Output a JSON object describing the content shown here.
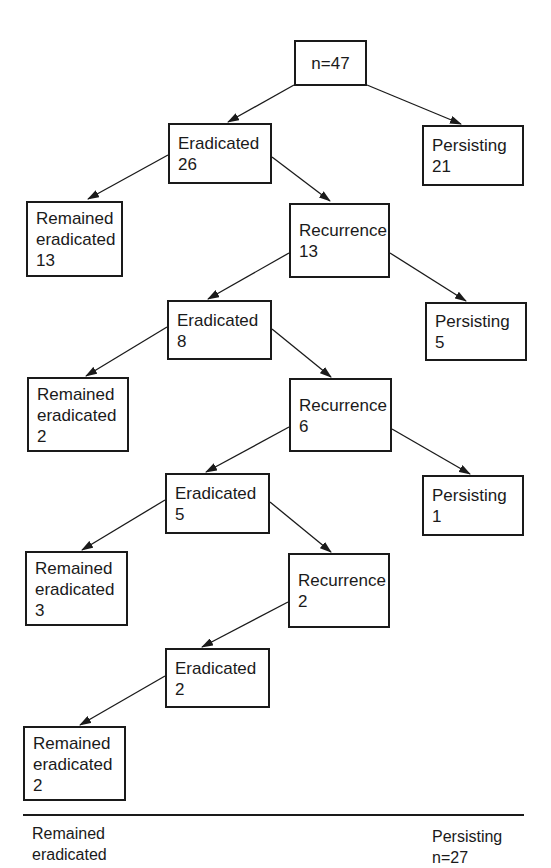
{
  "diagram": {
    "type": "flowchart-tree",
    "root": {
      "label": "n=47"
    },
    "nodes": [
      {
        "id": "erad1",
        "label": "Eradicated",
        "value": "26"
      },
      {
        "id": "pers1",
        "label": "Persisting",
        "value": "21"
      },
      {
        "id": "rem1",
        "label": "Remained eradicated",
        "value": "13"
      },
      {
        "id": "rec1",
        "label": "Recurrence",
        "value": "13"
      },
      {
        "id": "erad2",
        "label": "Eradicated",
        "value": "8"
      },
      {
        "id": "pers2",
        "label": "Persisting",
        "value": "5"
      },
      {
        "id": "rem2",
        "label": "Remained eradicated",
        "value": "2"
      },
      {
        "id": "rec2",
        "label": "Recurrence",
        "value": "6"
      },
      {
        "id": "erad3",
        "label": "Eradicated",
        "value": "5"
      },
      {
        "id": "pers3",
        "label": "Persisting",
        "value": "1"
      },
      {
        "id": "rem3",
        "label": "Remained eradicated",
        "value": "3"
      },
      {
        "id": "rec3",
        "label": "Recurrence",
        "value": "2"
      },
      {
        "id": "erad4",
        "label": "Eradicated",
        "value": "2"
      },
      {
        "id": "rem4",
        "label": "Remained eradicated",
        "value": "2"
      }
    ],
    "edges": [
      [
        "root",
        "erad1"
      ],
      [
        "root",
        "pers1"
      ],
      [
        "erad1",
        "rem1"
      ],
      [
        "erad1",
        "rec1"
      ],
      [
        "rec1",
        "erad2"
      ],
      [
        "rec1",
        "pers2"
      ],
      [
        "erad2",
        "rem2"
      ],
      [
        "erad2",
        "rec2"
      ],
      [
        "rec2",
        "erad3"
      ],
      [
        "rec2",
        "pers3"
      ],
      [
        "erad3",
        "rem3"
      ],
      [
        "erad3",
        "rec3"
      ],
      [
        "rec3",
        "erad4"
      ],
      [
        "erad4",
        "rem4"
      ]
    ],
    "labels": {
      "remained_line1": "Remained",
      "remained_line2": "eradicated",
      "eradicated": "Eradicated",
      "persisting": "Persisting",
      "recurrence": "Recurrence"
    },
    "footer": {
      "left_line1": "Remained",
      "left_line2": "eradicated",
      "right_line1": "Persisting",
      "right_line2": "n=27"
    }
  }
}
